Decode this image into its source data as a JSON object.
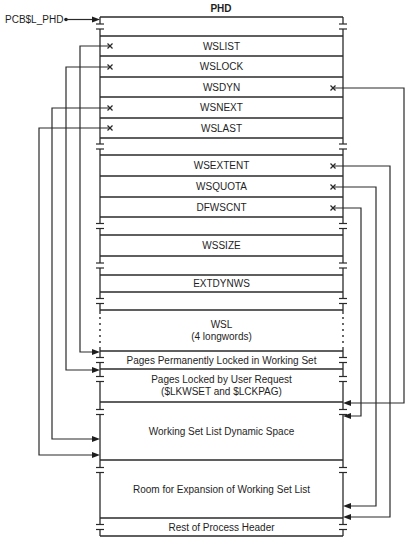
{
  "diagram": {
    "title": "PHD",
    "pointer_label": "PCB$L_PHD",
    "colors": {
      "line": "#2a2a2a",
      "text": "#1e1e1e",
      "background": "#ffffff"
    },
    "box": {
      "left": 100,
      "right": 343,
      "top": 17,
      "bottom": 536
    },
    "rows": [
      {
        "id": "top-blank",
        "y0": 17,
        "y1": 36,
        "lines": [],
        "break_left": true,
        "break_right": true
      },
      {
        "id": "wslist",
        "y0": 36,
        "y1": 56,
        "lines": [
          "WSLIST"
        ]
      },
      {
        "id": "wslock",
        "y0": 56,
        "y1": 77,
        "lines": [
          "WSLOCK"
        ]
      },
      {
        "id": "wsdyn",
        "y0": 77,
        "y1": 97,
        "lines": [
          "WSDYN"
        ]
      },
      {
        "id": "wsnext",
        "y0": 97,
        "y1": 118,
        "lines": [
          "WSNEXT"
        ]
      },
      {
        "id": "wslast",
        "y0": 118,
        "y1": 138,
        "lines": [
          "WSLAST"
        ]
      },
      {
        "id": "gap-1",
        "y0": 138,
        "y1": 155,
        "lines": [],
        "break_left": true,
        "break_right": true
      },
      {
        "id": "wsextent",
        "y0": 155,
        "y1": 176,
        "lines": [
          "WSEXTENT"
        ]
      },
      {
        "id": "wsquota",
        "y0": 176,
        "y1": 197,
        "lines": [
          "WSQUOTA"
        ]
      },
      {
        "id": "dfwscnt",
        "y0": 197,
        "y1": 217,
        "lines": [
          "DFWSCNT"
        ]
      },
      {
        "id": "gap-2",
        "y0": 217,
        "y1": 235,
        "lines": [],
        "break_left": true,
        "break_right": true
      },
      {
        "id": "wssize",
        "y0": 235,
        "y1": 256,
        "lines": [
          "WSSIZE"
        ]
      },
      {
        "id": "gap-3",
        "y0": 256,
        "y1": 275,
        "lines": [],
        "break_left": true,
        "break_right": true
      },
      {
        "id": "extdynws",
        "y0": 275,
        "y1": 292,
        "lines": [
          "EXTDYNWS"
        ]
      },
      {
        "id": "gap-4",
        "y0": 292,
        "y1": 310,
        "lines": [],
        "break_left": true,
        "break_right": true
      },
      {
        "id": "wsl",
        "y0": 310,
        "y1": 351,
        "lines": [
          "WSL",
          "(4 longwords)"
        ],
        "dotted_sides": true
      },
      {
        "id": "perm-locked",
        "y0": 351,
        "y1": 369,
        "lines": [
          "Pages Permanently Locked in Working Set"
        ],
        "break_left": true,
        "break_right": true
      },
      {
        "id": "user-locked",
        "y0": 369,
        "y1": 402,
        "lines": [
          "Pages Locked by User Request",
          "($LKWSET and $LCKPAG)"
        ],
        "break_left": true,
        "break_right": true
      },
      {
        "id": "wsl-dynamic",
        "y0": 402,
        "y1": 460,
        "lines": [
          "Working Set List Dynamic Space"
        ],
        "break_left": true,
        "break_right": true
      },
      {
        "id": "room-expansion",
        "y0": 460,
        "y1": 518,
        "lines": [
          "Room for Expansion of Working Set List"
        ],
        "break_left": true,
        "break_right": true
      },
      {
        "id": "rest-header",
        "y0": 518,
        "y1": 536,
        "lines": [
          "Rest of Process Header"
        ],
        "break_left": true,
        "break_right": true
      }
    ],
    "left_pointers": [
      {
        "field": "WSLIST",
        "from_y": 46,
        "route_x": 80,
        "to_y": 352
      },
      {
        "field": "WSLOCK",
        "from_y": 67,
        "route_x": 66,
        "to_y": 370
      },
      {
        "field": "WSNEXT",
        "from_y": 108,
        "route_x": 52,
        "to_y": 439
      },
      {
        "field": "WSLAST",
        "from_y": 128,
        "route_x": 39,
        "to_y": 455
      }
    ],
    "right_pointers": [
      {
        "field": "WSDYN",
        "from_y": 88,
        "route_x": 404,
        "to_y": 403
      },
      {
        "field": "WSEXTENT",
        "from_y": 166,
        "route_x": 390,
        "to_y": 517
      },
      {
        "field": "WSQUOTA",
        "from_y": 187,
        "route_x": 376,
        "to_y": 506
      },
      {
        "field": "DFWSCNT",
        "from_y": 208,
        "route_x": 361,
        "to_y": 416
      }
    ]
  }
}
